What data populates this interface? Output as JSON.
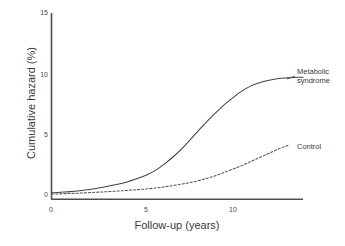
{
  "chart_data": {
    "type": "line",
    "title": "",
    "subtitle": "",
    "xlabel": "Follow-up (years)",
    "ylabel": "Cumulative hazard (%)",
    "xlim": [
      0,
      13.3
    ],
    "ylim": [
      0,
      15
    ],
    "xticks": [
      0,
      5,
      10
    ],
    "xtick_labels": [
      "0",
      "5",
      "10"
    ],
    "yticks": [
      0,
      5,
      10,
      15
    ],
    "ytick_labels": [
      "0",
      "5",
      "10",
      "15"
    ],
    "grid": false,
    "legend_position": "inline-right-annotations",
    "annotations": [
      {
        "text": "Metabolic syndrome",
        "x": 13.4,
        "y": 10.6
      },
      {
        "text": "Control",
        "x": 13.4,
        "y": 4.5
      }
    ],
    "series": [
      {
        "name": "Metabolic syndrome",
        "style": "solid",
        "color": "#444444",
        "x": [
          0,
          0.5,
          1,
          1.5,
          2,
          2.5,
          3,
          3.5,
          4,
          4.5,
          5,
          5.5,
          6,
          6.5,
          7,
          7.5,
          8,
          8.5,
          9,
          9.5,
          10,
          10.5,
          11,
          11.5,
          12,
          12.5,
          13,
          13.3
        ],
        "values": [
          0.3,
          0.35,
          0.4,
          0.48,
          0.58,
          0.7,
          0.85,
          1.0,
          1.2,
          1.45,
          1.75,
          2.15,
          2.7,
          3.35,
          4.1,
          4.95,
          5.8,
          6.6,
          7.35,
          8.0,
          8.6,
          9.05,
          9.35,
          9.55,
          9.7,
          9.75,
          9.8,
          9.8
        ]
      },
      {
        "name": "Control",
        "style": "dashed",
        "color": "#555555",
        "x": [
          0,
          0.5,
          1,
          1.5,
          2,
          2.5,
          3,
          3.5,
          4,
          4.5,
          5,
          5.5,
          6,
          6.5,
          7,
          7.5,
          8,
          8.5,
          9,
          9.5,
          10,
          10.5,
          11,
          11.5,
          12,
          12.5
        ],
        "values": [
          0.2,
          0.22,
          0.25,
          0.28,
          0.32,
          0.36,
          0.4,
          0.45,
          0.5,
          0.56,
          0.62,
          0.7,
          0.8,
          0.92,
          1.05,
          1.2,
          1.4,
          1.62,
          1.9,
          2.2,
          2.5,
          2.85,
          3.2,
          3.55,
          3.9,
          4.2
        ]
      }
    ]
  },
  "axes": {
    "ylabel": "Cumulative hazard (%)",
    "xlabel": "Follow-up (years)",
    "ytick_0": "0",
    "ytick_5": "5",
    "ytick_10": "10",
    "ytick_15": "15",
    "xtick_0": "0",
    "xtick_5": "5",
    "xtick_10": "10"
  },
  "labels": {
    "metabolic_line1": "Metabolic",
    "metabolic_line2": "syndrome",
    "control": "Control"
  },
  "colors": {
    "axis": "#4d4d4d",
    "metabolic_curve": "#444444",
    "control_curve": "#555555",
    "text": "#3a3a3a",
    "background": "#ffffff"
  }
}
